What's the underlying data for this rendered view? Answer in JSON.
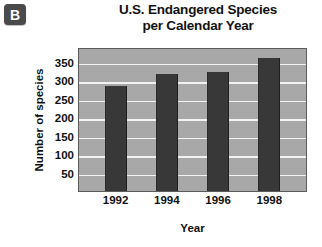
{
  "badge": {
    "label": "B"
  },
  "chart_data": {
    "type": "bar",
    "title": "U.S. Endangered Species per Calendar Year",
    "title_line1": "U.S. Endangered Species",
    "title_line2": "per Calendar Year",
    "categories": [
      "1992",
      "1994",
      "1996",
      "1998"
    ],
    "values": [
      285,
      318,
      322,
      360
    ],
    "xlabel": "Year",
    "ylabel": "Number of species",
    "yticks": [
      350,
      300,
      250,
      200,
      150,
      100,
      50
    ],
    "ylim": [
      0,
      390
    ],
    "grid": true,
    "legend": "none",
    "colors": {
      "bar": "#383838",
      "plot_background": "#a8a8a8",
      "gridline": "#f2f2f2",
      "plot_border": "#5b5b5b",
      "badge": "#4a4a4a",
      "text": "#111111"
    }
  }
}
